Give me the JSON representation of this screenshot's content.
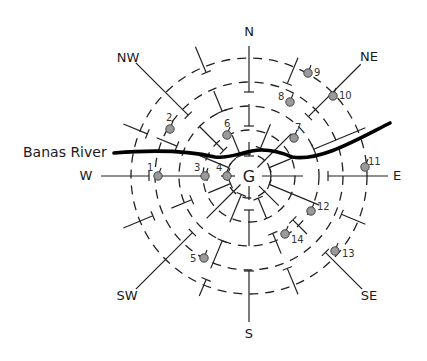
{
  "diagram": {
    "center": {
      "label": "G",
      "x": 249,
      "y": 176
    },
    "ring_radii": [
      22,
      46,
      70,
      94,
      118
    ],
    "directions": [
      {
        "label": "N",
        "x": 249,
        "y": 36
      },
      {
        "label": "NE",
        "x": 369,
        "y": 61
      },
      {
        "label": "E",
        "x": 397,
        "y": 180
      },
      {
        "label": "SE",
        "x": 369,
        "y": 300
      },
      {
        "label": "S",
        "x": 249,
        "y": 338
      },
      {
        "label": "SW",
        "x": 127,
        "y": 300
      },
      {
        "label": "W",
        "x": 86,
        "y": 180
      },
      {
        "label": "NW",
        "x": 128,
        "y": 62
      }
    ],
    "river": {
      "label": "Banas River",
      "label_x": 23,
      "label_y": 157,
      "path": "M114,153 C150,150 185,150 215,157 C240,160 252,140 292,157 C320,162 360,138 390,123"
    },
    "sample_points": [
      {
        "id": "1",
        "x": 158,
        "y": 176,
        "lx": 147,
        "ly": 171
      },
      {
        "id": "2",
        "x": 170,
        "y": 129,
        "lx": 166,
        "ly": 121
      },
      {
        "id": "3",
        "x": 205,
        "y": 176,
        "lx": 194,
        "ly": 171
      },
      {
        "id": "4",
        "x": 227,
        "y": 176,
        "lx": 216,
        "ly": 171
      },
      {
        "id": "5",
        "x": 204,
        "y": 258,
        "lx": 190,
        "ly": 262
      },
      {
        "id": "6",
        "x": 227,
        "y": 135,
        "lx": 224,
        "ly": 127
      },
      {
        "id": "7",
        "x": 294,
        "y": 138,
        "lx": 295,
        "ly": 131
      },
      {
        "id": "8",
        "x": 290,
        "y": 102,
        "lx": 278,
        "ly": 100
      },
      {
        "id": "9",
        "x": 308,
        "y": 73,
        "lx": 314,
        "ly": 76
      },
      {
        "id": "10",
        "x": 333,
        "y": 96,
        "lx": 339,
        "ly": 99
      },
      {
        "id": "11",
        "x": 365,
        "y": 167,
        "lx": 368,
        "ly": 165
      },
      {
        "id": "12",
        "x": 311,
        "y": 211,
        "lx": 317,
        "ly": 210
      },
      {
        "id": "13",
        "x": 335,
        "y": 251,
        "lx": 342,
        "ly": 257
      },
      {
        "id": "14",
        "x": 285,
        "y": 234,
        "lx": 291,
        "ly": 243
      }
    ]
  }
}
